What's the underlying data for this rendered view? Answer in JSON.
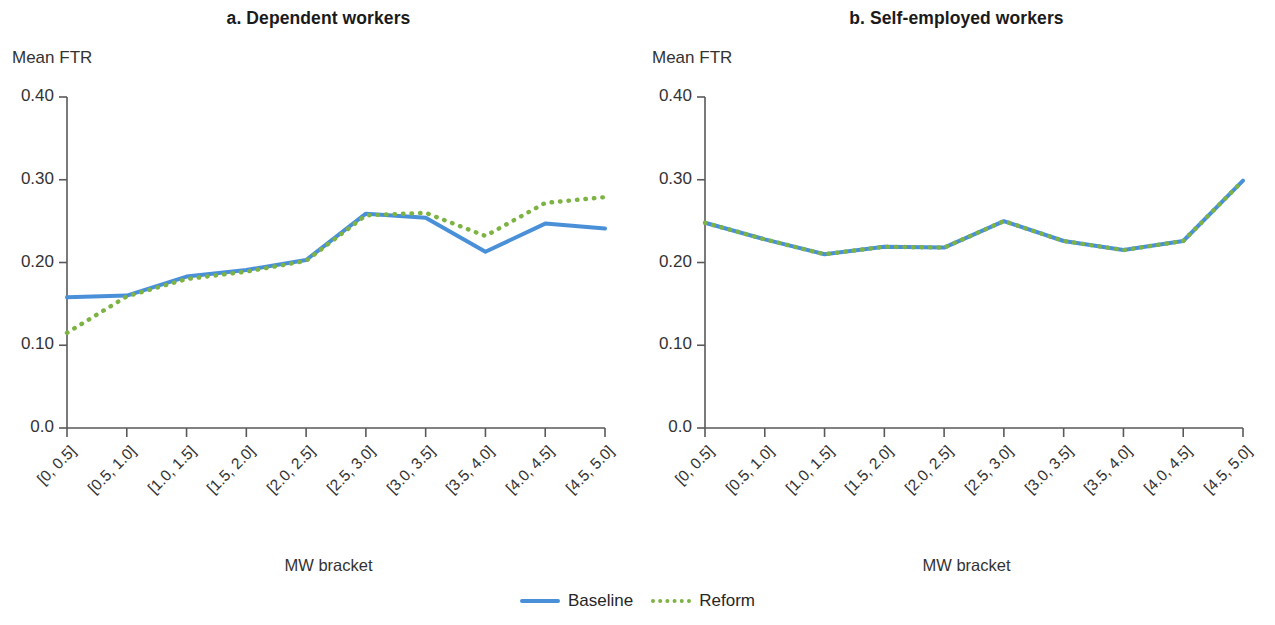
{
  "figure": {
    "panels": [
      {
        "id": "a",
        "title": "a. Dependent workers",
        "ylabel": "Mean FTR",
        "xlabel": "MW bracket"
      },
      {
        "id": "b",
        "title": "b. Self-employed workers",
        "ylabel": "Mean FTR",
        "xlabel": "MW bracket"
      }
    ],
    "legend": {
      "position": "bottom-center",
      "entries": [
        {
          "label": "Baseline",
          "style": "solid",
          "color": "#4A90D9"
        },
        {
          "label": "Reform",
          "style": "dotted",
          "color": "#7CB342"
        }
      ]
    }
  },
  "colors": {
    "baseline": "#4A90D9",
    "reform": "#7CB342",
    "axis": "#595959",
    "text": "#333333"
  },
  "chart_data": [
    {
      "type": "line",
      "title": "a. Dependent workers",
      "xlabel": "MW bracket",
      "ylabel": "Mean FTR",
      "categories": [
        "[0, 0.5]",
        "[0.5, 1.0]",
        "[1.0, 1.5]",
        "[1.5, 2.0]",
        "[2.0, 2.5]",
        "[2.5, 3.0]",
        "[3.0, 3.5]",
        "[3.5, 4.0]",
        "[4.0, 4.5]",
        "[4.5, 5.0]"
      ],
      "series": [
        {
          "name": "Baseline",
          "style": "solid",
          "color": "#4A90D9",
          "values": [
            0.158,
            0.16,
            0.183,
            0.191,
            0.203,
            0.259,
            0.254,
            0.213,
            0.247,
            0.241
          ]
        },
        {
          "name": "Reform",
          "style": "dotted",
          "color": "#7CB342",
          "values": [
            0.115,
            0.159,
            0.18,
            0.189,
            0.202,
            0.257,
            0.26,
            0.232,
            0.272,
            0.279
          ]
        }
      ],
      "ylim": [
        0.0,
        0.4
      ],
      "yticks": [
        "0.0",
        "0.10",
        "0.20",
        "0.30",
        "0.40"
      ],
      "ytick_values": [
        0.0,
        0.1,
        0.2,
        0.3,
        0.4
      ],
      "grid": false,
      "legend": "bottom-center"
    },
    {
      "type": "line",
      "title": "b. Self-employed workers",
      "xlabel": "MW bracket",
      "ylabel": "Mean FTR",
      "categories": [
        "[0, 0.5]",
        "[0.5, 1.0]",
        "[1.0, 1.5]",
        "[1.5, 2.0]",
        "[2.0, 2.5]",
        "[2.5, 3.0]",
        "[3.0, 3.5]",
        "[3.5, 4.0]",
        "[4.0, 4.5]",
        "[4.5, 5.0]"
      ],
      "series": [
        {
          "name": "Baseline",
          "style": "solid",
          "color": "#4A90D9",
          "values": [
            0.248,
            0.228,
            0.21,
            0.219,
            0.218,
            0.25,
            0.226,
            0.215,
            0.226,
            0.299
          ]
        },
        {
          "name": "Reform",
          "style": "dotted",
          "color": "#7CB342",
          "values": [
            0.248,
            0.228,
            0.21,
            0.219,
            0.218,
            0.25,
            0.226,
            0.215,
            0.226,
            0.299
          ]
        }
      ],
      "ylim": [
        0.0,
        0.4
      ],
      "yticks": [
        "0.0",
        "0.10",
        "0.20",
        "0.30",
        "0.40"
      ],
      "ytick_values": [
        0.0,
        0.1,
        0.2,
        0.3,
        0.4
      ],
      "grid": false,
      "legend": "bottom-center"
    }
  ]
}
